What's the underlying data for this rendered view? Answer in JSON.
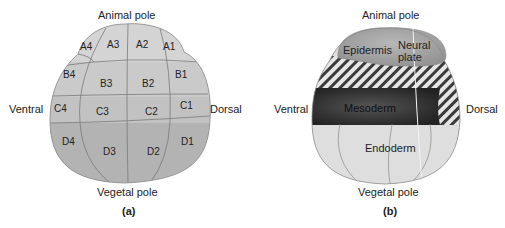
{
  "panel_a": {
    "caption": "(a)",
    "labels": {
      "top": "Animal pole",
      "bottom": "Vegetal pole",
      "left": "Ventral",
      "right": "Dorsal"
    },
    "cells": {
      "A1": "A1",
      "A2": "A2",
      "A3": "A3",
      "A4": "A4",
      "B1": "B1",
      "B2": "B2",
      "B3": "B3",
      "B4": "B4",
      "C1": "C1",
      "C2": "C2",
      "C3": "C3",
      "C4": "C4",
      "D1": "D1",
      "D2": "D2",
      "D3": "D3",
      "D4": "D4"
    }
  },
  "panel_b": {
    "caption": "(b)",
    "labels": {
      "top": "Animal pole",
      "bottom": "Vegetal pole",
      "left": "Ventral",
      "right": "Dorsal"
    },
    "regions": {
      "epidermis": "Epidermis",
      "neural_plate_1": "Neural",
      "neural_plate_2": "plate",
      "mesoderm": "Mesoderm",
      "endoderm": "Endoderm"
    }
  },
  "colors": {
    "cell_light": "#d2d2d2",
    "cell_mid": "#bdbdbd",
    "cell_dark": "#a9a9a9",
    "mesoderm": "#3a3a3a",
    "endoderm": "#dedede",
    "animal_cap": "#a6a6a6"
  }
}
